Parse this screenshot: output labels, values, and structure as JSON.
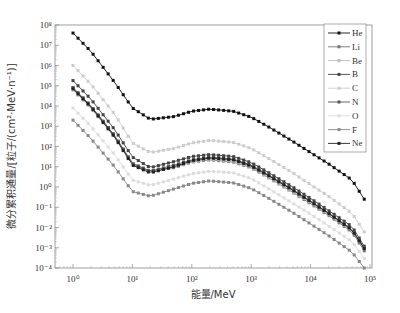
{
  "chart_data": {
    "type": "line",
    "title": "",
    "xlabel": "能量/MeV",
    "ylabel": "微分累积通量/[粒子/(cm²·MeV·n⁻¹)]",
    "xscale": "log",
    "yscale": "log",
    "xlim": [
      1,
      100000
    ],
    "ylim": [
      0.0001,
      100000000
    ],
    "grid": false,
    "legend_position": "upper right",
    "x_ticks": [
      "10⁰",
      "10¹",
      "10²",
      "10³",
      "10⁴",
      "10⁵"
    ],
    "y_ticks": [
      "10⁻⁴",
      "10⁻³",
      "10⁻²",
      "10⁻¹",
      "10⁰",
      "10¹",
      "10²",
      "10³",
      "10⁴",
      "10⁵",
      "10⁶",
      "10⁷",
      "10⁸"
    ],
    "x": [
      1,
      2,
      5,
      10,
      20,
      50,
      100,
      200,
      500,
      1000,
      2000,
      5000,
      10000,
      20000,
      50000,
      80000
    ],
    "series": [
      {
        "name": "He",
        "color": "#111111",
        "values": [
          40000000.0,
          5000000.0,
          150000.0,
          8000.0,
          2200.0,
          3000.0,
          5500.0,
          7000.0,
          5500.0,
          2800.0,
          900,
          180,
          50,
          14,
          2.2,
          0.25
        ]
      },
      {
        "name": "Li",
        "color": "#777777",
        "values": [
          80000.0,
          10000.0,
          350.0,
          15,
          6,
          9,
          17,
          22,
          17,
          9,
          2.8,
          0.55,
          0.15,
          0.04,
          0.006,
          0.0007
        ]
      },
      {
        "name": "Be",
        "color": "#bbbbbb",
        "values": [
          60000.0,
          8000.0,
          300.0,
          14,
          6,
          10,
          18,
          24,
          19,
          10,
          3.0,
          0.6,
          0.17,
          0.045,
          0.007,
          0.0009
        ]
      },
      {
        "name": "B",
        "color": "#444444",
        "values": [
          180000.0,
          22000.0,
          700.0,
          30,
          9,
          18,
          32,
          40,
          32,
          16,
          5.0,
          1.0,
          0.27,
          0.07,
          0.011,
          0.0012
        ]
      },
      {
        "name": "C",
        "color": "#cccccc",
        "values": [
          1000000.0,
          120000.0,
          4000.0,
          150.0,
          50,
          80,
          150,
          200,
          160,
          80,
          25,
          5,
          1.3,
          0.35,
          0.05,
          0.006
        ]
      },
      {
        "name": "N",
        "color": "#555555",
        "values": [
          80000.0,
          10000.0,
          350.0,
          14,
          6,
          12,
          22,
          30,
          24,
          12,
          3.8,
          0.75,
          0.2,
          0.052,
          0.008,
          0.001
        ]
      },
      {
        "name": "O",
        "color": "#dddddd",
        "values": [
          8000.0,
          1000.0,
          40,
          2.2,
          1.2,
          2.5,
          4.5,
          6.0,
          5.0,
          2.6,
          0.8,
          0.16,
          0.045,
          0.012,
          0.002,
          0.0003
        ]
      },
      {
        "name": "F",
        "color": "#888888",
        "values": [
          2000.0,
          250.0,
          10,
          0.6,
          0.35,
          0.8,
          1.5,
          2.0,
          1.6,
          0.85,
          0.27,
          0.055,
          0.015,
          0.004,
          0.0006,
          0.0001
        ]
      },
      {
        "name": "Ne",
        "color": "#222222",
        "values": [
          70000.0,
          9000.0,
          300.0,
          12,
          5,
          10,
          20,
          27,
          22,
          11,
          3.5,
          0.7,
          0.19,
          0.05,
          0.0075,
          0.0009
        ]
      }
    ]
  }
}
